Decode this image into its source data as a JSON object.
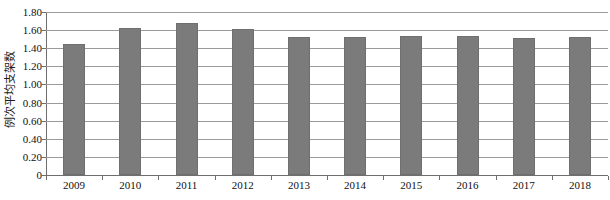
{
  "chart_data": {
    "type": "bar",
    "title": "",
    "xlabel": "",
    "ylabel": "例次平均支架数",
    "categories": [
      "2009",
      "2010",
      "2011",
      "2012",
      "2013",
      "2014",
      "2015",
      "2016",
      "2017",
      "2018"
    ],
    "values": [
      1.45,
      1.62,
      1.68,
      1.61,
      1.52,
      1.52,
      1.53,
      1.53,
      1.51,
      1.52
    ],
    "ylim": [
      0,
      1.8
    ],
    "ytick_labels": [
      "0",
      "0.20",
      "0.40",
      "0.60",
      "0.80",
      "1.00",
      "1.20",
      "1.40",
      "1.60",
      "1.80"
    ],
    "ytick_values": [
      0,
      0.2,
      0.4,
      0.6,
      0.8,
      1.0,
      1.2,
      1.4,
      1.6,
      1.8
    ],
    "grid": true,
    "legend": "none",
    "series_color": "#7b7b7b",
    "axis_color": "#6e6e6e",
    "grid_color": "#9a9a9a"
  }
}
